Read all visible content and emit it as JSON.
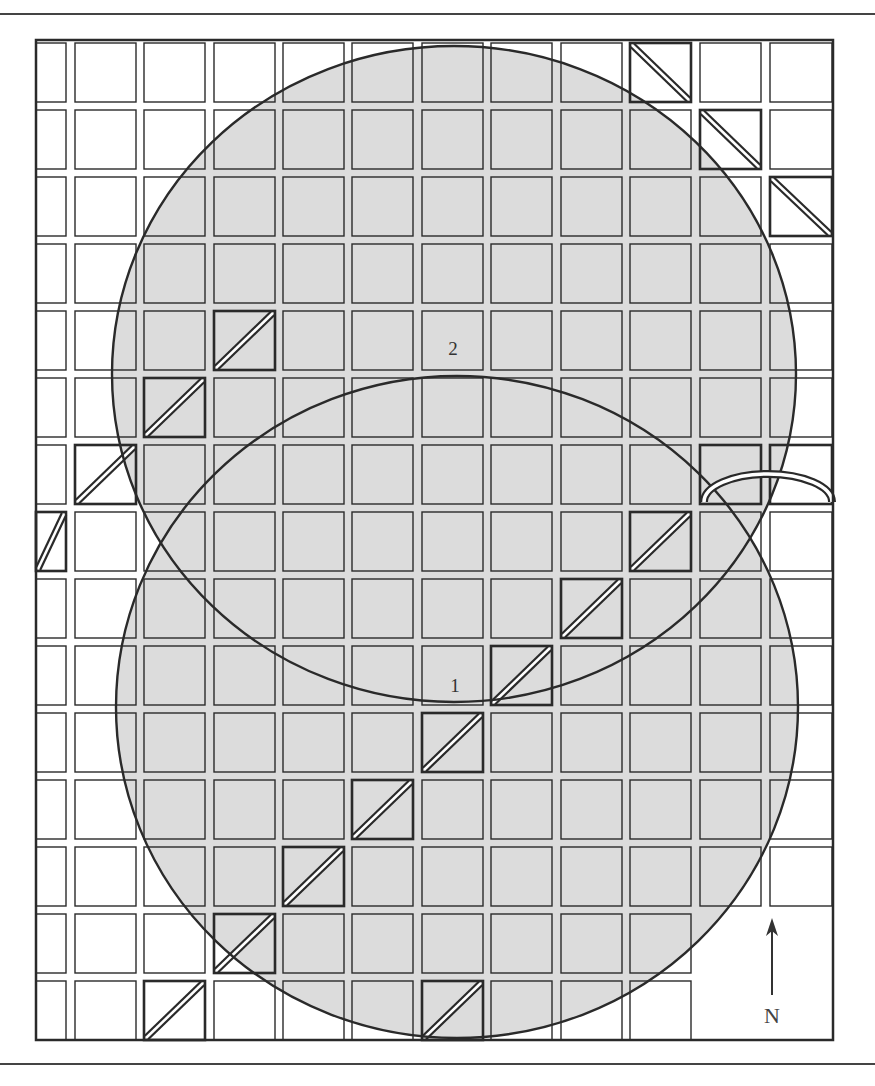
{
  "figure": {
    "frame": {
      "x": 36,
      "y": 40,
      "width": 797,
      "height": 1000
    },
    "rules": {
      "top_y": 13,
      "bottom_y": 1063
    },
    "colors": {
      "shade": "#dcdcdc",
      "line": "#2a2a2a",
      "background": "#ffffff"
    },
    "grid": {
      "columns": [
        {
          "x": 36,
          "w": 30
        },
        {
          "x": 75,
          "w": 61
        },
        {
          "x": 144,
          "w": 61
        },
        {
          "x": 214,
          "w": 61
        },
        {
          "x": 283,
          "w": 61
        },
        {
          "x": 352,
          "w": 61
        },
        {
          "x": 422,
          "w": 61
        },
        {
          "x": 491,
          "w": 61
        },
        {
          "x": 561,
          "w": 61
        },
        {
          "x": 630,
          "w": 61
        },
        {
          "x": 700,
          "w": 61
        },
        {
          "x": 770,
          "w": 62
        }
      ],
      "rows": [
        {
          "y": 43,
          "h": 59
        },
        {
          "y": 110,
          "h": 59
        },
        {
          "y": 177,
          "h": 59
        },
        {
          "y": 244,
          "h": 59
        },
        {
          "y": 311,
          "h": 59
        },
        {
          "y": 378,
          "h": 59
        },
        {
          "y": 445,
          "h": 59
        },
        {
          "y": 512,
          "h": 59
        },
        {
          "y": 579,
          "h": 59
        },
        {
          "y": 646,
          "h": 59
        },
        {
          "y": 713,
          "h": 59
        },
        {
          "y": 780,
          "h": 59
        },
        {
          "y": 847,
          "h": 59
        },
        {
          "y": 914,
          "h": 59
        },
        {
          "y": 981,
          "h": 59
        }
      ],
      "missing_cells": [
        [
          13,
          10
        ],
        [
          13,
          11
        ],
        [
          14,
          10
        ],
        [
          14,
          11
        ]
      ]
    },
    "diagonal_cells": [
      {
        "row": 0,
        "col": 9,
        "dir": "down"
      },
      {
        "row": 1,
        "col": 10,
        "dir": "down"
      },
      {
        "row": 2,
        "col": 11,
        "dir": "down"
      },
      {
        "row": 4,
        "col": 3,
        "dir": "up"
      },
      {
        "row": 5,
        "col": 2,
        "dir": "up"
      },
      {
        "row": 6,
        "col": 1,
        "dir": "up"
      },
      {
        "row": 7,
        "col": 0,
        "dir": "up"
      },
      {
        "row": 7,
        "col": 9,
        "dir": "up"
      },
      {
        "row": 8,
        "col": 8,
        "dir": "up"
      },
      {
        "row": 9,
        "col": 7,
        "dir": "up"
      },
      {
        "row": 10,
        "col": 6,
        "dir": "up"
      },
      {
        "row": 11,
        "col": 5,
        "dir": "up"
      },
      {
        "row": 12,
        "col": 4,
        "dir": "up"
      },
      {
        "row": 13,
        "col": 3,
        "dir": "up"
      },
      {
        "row": 14,
        "col": 2,
        "dir": "up"
      },
      {
        "row": 14,
        "col": 6,
        "dir": "up"
      }
    ],
    "bold_cells": [
      {
        "row": 6,
        "col": 10
      },
      {
        "row": 6,
        "col": 11
      }
    ],
    "arc_road": {
      "x1": 704,
      "x2": 832,
      "base_y": 502,
      "peak_y": 474
    },
    "circles": [
      {
        "id": "1",
        "label": "1",
        "cx": 457,
        "cy": 707,
        "rx": 341,
        "ry": 331,
        "label_x": 455,
        "label_y": 686
      },
      {
        "id": "2",
        "label": "2",
        "cx": 454,
        "cy": 374,
        "rx": 342,
        "ry": 328,
        "label_x": 453,
        "label_y": 349
      }
    ],
    "north_arrow": {
      "x": 772,
      "y_top": 918,
      "y_bottom": 995,
      "label": "N",
      "label_x": 772,
      "label_y": 1016
    }
  }
}
